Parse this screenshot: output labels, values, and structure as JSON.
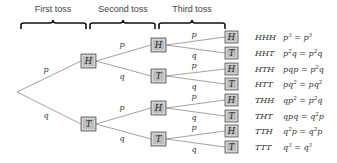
{
  "headers": {
    "first": "First toss",
    "second": "Second toss",
    "third": "Third toss"
  },
  "branch_labels": {
    "heads": "p",
    "tails": "q"
  },
  "level1": [
    {
      "label": "H"
    },
    {
      "label": "T"
    }
  ],
  "level2": [
    {
      "label": "H"
    },
    {
      "label": "T"
    },
    {
      "label": "H"
    },
    {
      "label": "T"
    }
  ],
  "outcomes": [
    {
      "leaf": "H",
      "sequence": "HHH",
      "prob_lhs": "p^3",
      "prob_rhs": "p^3"
    },
    {
      "leaf": "T",
      "sequence": "HHT",
      "prob_lhs": "p^2 q",
      "prob_rhs": "p^2 q"
    },
    {
      "leaf": "H",
      "sequence": "HTH",
      "prob_lhs": "pqp",
      "prob_rhs": "p^2 q"
    },
    {
      "leaf": "T",
      "sequence": "HTT",
      "prob_lhs": "pq^2",
      "prob_rhs": "pq^2"
    },
    {
      "leaf": "H",
      "sequence": "THH",
      "prob_lhs": "qp^2",
      "prob_rhs": "p^2 q"
    },
    {
      "leaf": "T",
      "sequence": "THT",
      "prob_lhs": "qpq",
      "prob_rhs": "q^2 p"
    },
    {
      "leaf": "H",
      "sequence": "TTH",
      "prob_lhs": "q^2 p",
      "prob_rhs": "q^2 p"
    },
    {
      "leaf": "T",
      "sequence": "TTT",
      "prob_lhs": "q^3",
      "prob_rhs": "q^3"
    }
  ],
  "colors": {
    "box_fill": "#bdbdbd",
    "box_stroke": "#555555",
    "edge": "#8a8a8a",
    "brace": "#111111"
  }
}
